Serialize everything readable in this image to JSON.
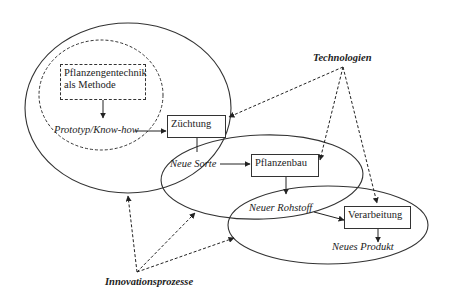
{
  "diagram": {
    "nodes": {
      "gentechnik": {
        "line1": "Pflanzengentechnik",
        "line2": "als Methode"
      },
      "prototyp": "Prototyp/Know-how",
      "zuechtung": "Züchtung",
      "neue_sorte": "Neue Sorte",
      "pflanzenbau": "Pflanzenbau",
      "neuer_rohstoff": "Neuer Rohstoff",
      "verarbeitung": "Verarbeitung",
      "neues_produkt": "Neues Produkt"
    },
    "sources": {
      "technologien": "Technologien",
      "innovationsprozesse": "Innovationsprozesse"
    },
    "edges": [
      {
        "from": "Pflanzengentechnik als Methode",
        "to": "Prototyp/Know-how",
        "style": "solid"
      },
      {
        "from": "Prototyp/Know-how",
        "to": "Züchtung",
        "style": "solid"
      },
      {
        "from": "Züchtung",
        "to": "Neue Sorte",
        "style": "solid"
      },
      {
        "from": "Neue Sorte",
        "to": "Pflanzenbau",
        "style": "solid"
      },
      {
        "from": "Pflanzenbau",
        "to": "Neuer Rohstoff",
        "style": "solid"
      },
      {
        "from": "Neuer Rohstoff",
        "to": "Verarbeitung",
        "style": "solid"
      },
      {
        "from": "Verarbeitung",
        "to": "Neues Produkt",
        "style": "solid"
      },
      {
        "from": "Technologien",
        "to": "Züchtung",
        "style": "dashed"
      },
      {
        "from": "Technologien",
        "to": "Pflanzenbau",
        "style": "dashed"
      },
      {
        "from": "Technologien",
        "to": "Verarbeitung",
        "style": "dashed"
      },
      {
        "from": "Innovationsprozesse",
        "to": "ellipse-1",
        "style": "dashed"
      },
      {
        "from": "Innovationsprozesse",
        "to": "ellipse-2",
        "style": "dashed"
      },
      {
        "from": "Innovationsprozesse",
        "to": "ellipse-3",
        "style": "dashed"
      }
    ]
  }
}
